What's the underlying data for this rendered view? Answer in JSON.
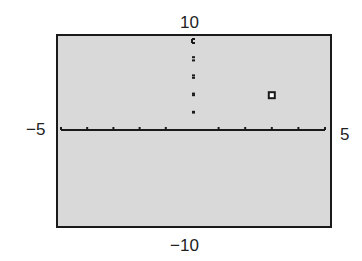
{
  "chart_data": {
    "type": "scatter",
    "title": "",
    "xlabel": "",
    "ylabel": "",
    "xlim": [
      -5,
      5
    ],
    "ylim": [
      -10,
      10
    ],
    "x_tick_spacing": 1,
    "y_tick_spacing": 2,
    "grid": false,
    "points": [
      {
        "x": 3,
        "y": 4
      }
    ],
    "marker": "hollow-square",
    "window_labels": {
      "xmin": "−5",
      "xmax": "5",
      "ymin": "−10",
      "ymax": "10"
    }
  },
  "colors": {
    "screen_bg": "#d9d9d9",
    "axis": "#1a1a1a"
  }
}
